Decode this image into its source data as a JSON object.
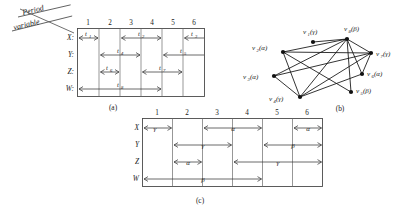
{
  "figure": {
    "header": {
      "line1": "Period",
      "line2": "variable"
    },
    "captions": {
      "a": "(a)",
      "b": "(b)",
      "c": "(c)"
    }
  },
  "panel_a": {
    "name": "timing-diagram-a",
    "column_numbers": [
      "1",
      "2",
      "3",
      "4",
      "5",
      "6"
    ],
    "row_labels": [
      "X:",
      "Y:",
      "Z:",
      "W:"
    ],
    "intervals": [
      {
        "row": "X",
        "label": "t",
        "sub": "1",
        "start_col": 1,
        "end_col": 1
      },
      {
        "row": "X",
        "label": "t",
        "sub": "2",
        "start_col": 3,
        "end_col": 4
      },
      {
        "row": "X",
        "label": "t",
        "sub": "3",
        "start_col": 6,
        "end_col": 6
      },
      {
        "row": "Y",
        "label": "t",
        "sub": "4",
        "start_col": 2,
        "end_col": 3
      },
      {
        "row": "Y",
        "label": "t",
        "sub": "5",
        "start_col": 5,
        "end_col": 6
      },
      {
        "row": "Z",
        "label": "t",
        "sub": "6",
        "start_col": 2,
        "end_col": 2
      },
      {
        "row": "Z",
        "label": "t",
        "sub": "7",
        "start_col": 4,
        "end_col": 5
      },
      {
        "row": "W",
        "label": "t",
        "sub": "8",
        "start_col": 1,
        "end_col": 4
      }
    ]
  },
  "panel_b": {
    "name": "graph-b",
    "vertices": [
      {
        "id": "v1",
        "label": "v",
        "sub": "1",
        "group": "(γ)",
        "x": 313,
        "y": 42
      },
      {
        "id": "v2",
        "label": "v",
        "sub": "2",
        "group": "(α)",
        "x": 283,
        "y": 52
      },
      {
        "id": "v3",
        "label": "v",
        "sub": "3",
        "group": "(α)",
        "x": 274,
        "y": 76
      },
      {
        "id": "v4",
        "label": "v",
        "sub": "4",
        "group": "(γ)",
        "x": 300,
        "y": 97
      },
      {
        "id": "v5",
        "label": "v",
        "sub": "5",
        "group": "(β)",
        "x": 351,
        "y": 92
      },
      {
        "id": "v6",
        "label": "v",
        "sub": "6",
        "group": "(α)",
        "x": 362,
        "y": 74
      },
      {
        "id": "v7",
        "label": "v",
        "sub": "7",
        "group": "(γ)",
        "x": 371,
        "y": 53
      },
      {
        "id": "v8",
        "label": "v",
        "sub": "8",
        "group": "(β)",
        "x": 347,
        "y": 39
      }
    ],
    "edges": [
      [
        "v1",
        "v8"
      ],
      [
        "v2",
        "v8"
      ],
      [
        "v2",
        "v7"
      ],
      [
        "v2",
        "v4"
      ],
      [
        "v2",
        "v5"
      ],
      [
        "v3",
        "v8"
      ],
      [
        "v3",
        "v7"
      ],
      [
        "v3",
        "v4"
      ],
      [
        "v4",
        "v8"
      ],
      [
        "v4",
        "v7"
      ],
      [
        "v4",
        "v6"
      ],
      [
        "v5",
        "v8"
      ],
      [
        "v6",
        "v8"
      ],
      [
        "v7",
        "v8"
      ],
      [
        "v6",
        "v7"
      ]
    ]
  },
  "panel_c": {
    "name": "timing-diagram-c",
    "column_numbers": [
      "1",
      "2",
      "3",
      "4",
      "5",
      "6"
    ],
    "row_labels": [
      "X",
      "Y",
      "Z",
      "W"
    ],
    "intervals": [
      {
        "row": "X",
        "symbol": "γ",
        "start_col": 1,
        "end_col": 1
      },
      {
        "row": "X",
        "symbol": "α",
        "start_col": 3,
        "end_col": 4
      },
      {
        "row": "X",
        "symbol": "α",
        "start_col": 6,
        "end_col": 6
      },
      {
        "row": "Y",
        "symbol": "γ",
        "start_col": 2,
        "end_col": 3
      },
      {
        "row": "Y",
        "symbol": "β",
        "start_col": 5,
        "end_col": 6
      },
      {
        "row": "Z",
        "symbol": "α",
        "start_col": 2,
        "end_col": 2
      },
      {
        "row": "Z",
        "symbol": "γ",
        "start_col": 4,
        "end_col": 6
      },
      {
        "row": "W",
        "symbol": "β",
        "start_col": 1,
        "end_col": 4
      }
    ]
  }
}
